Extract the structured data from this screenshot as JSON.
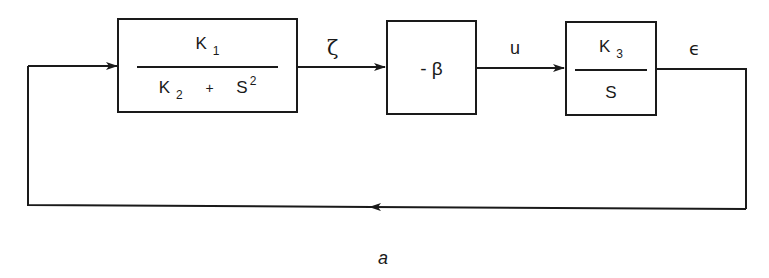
{
  "diagram": {
    "type": "block-diagram",
    "caption": "a",
    "blocks": [
      {
        "id": "block1",
        "numerator": {
          "base": "K",
          "sub": "1"
        },
        "denominator": {
          "term1_base": "K",
          "term1_sub": "2",
          "operator": "+",
          "term2_base": "S",
          "term2_sup": "2"
        }
      },
      {
        "id": "block2",
        "text": "- β"
      },
      {
        "id": "block3",
        "numerator": {
          "base": "K",
          "sub": "3"
        },
        "denominator": {
          "base": "S"
        }
      }
    ],
    "signals": {
      "block1_to_block2": "ζ",
      "block2_to_block3": "u",
      "output": "ϵ"
    },
    "feedback": "unity feedback from ϵ back to block1 input",
    "colors": {
      "stroke": "#1a1a1a",
      "background": "#ffffff"
    }
  }
}
